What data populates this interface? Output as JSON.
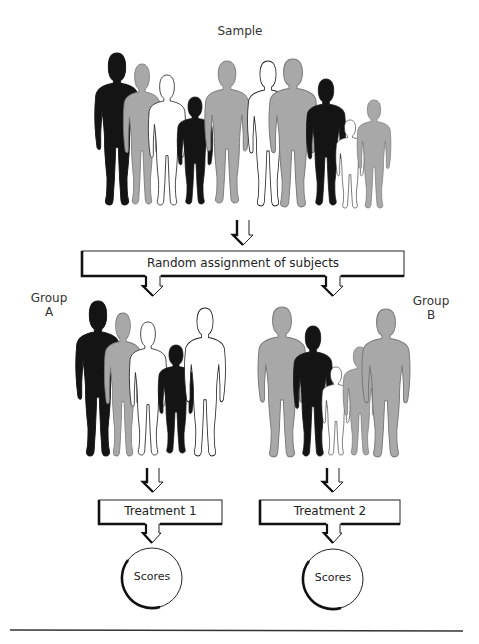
{
  "figure": {
    "sample_label": "Sample",
    "assignment_label": "Random assignment of subjects",
    "group_a": {
      "label_line1": "Group",
      "label_line2": "A"
    },
    "group_b": {
      "label_line1": "Group",
      "label_line2": "B"
    },
    "treatment_1_label": "Treatment 1",
    "treatment_2_label": "Treatment 2",
    "outcome_a_label": "Scores",
    "outcome_b_label": "Scores"
  },
  "sample_people": [
    {
      "fill": "black",
      "size": "tall"
    },
    {
      "fill": "gray",
      "size": "medium"
    },
    {
      "fill": "white",
      "size": "medium"
    },
    {
      "fill": "black",
      "size": "short"
    },
    {
      "fill": "gray",
      "size": "tall"
    },
    {
      "fill": "white",
      "size": "tall"
    },
    {
      "fill": "gray",
      "size": "tall"
    },
    {
      "fill": "black",
      "size": "medium"
    },
    {
      "fill": "white",
      "size": "child"
    },
    {
      "fill": "gray",
      "size": "short"
    }
  ],
  "group_a_people": [
    {
      "fill": "black",
      "size": "tall"
    },
    {
      "fill": "gray",
      "size": "medium"
    },
    {
      "fill": "white",
      "size": "medium"
    },
    {
      "fill": "black",
      "size": "short"
    },
    {
      "fill": "white",
      "size": "tall"
    }
  ],
  "group_b_people": [
    {
      "fill": "gray",
      "size": "tall"
    },
    {
      "fill": "black",
      "size": "medium"
    },
    {
      "fill": "white",
      "size": "child"
    },
    {
      "fill": "gray",
      "size": "short"
    },
    {
      "fill": "gray",
      "size": "tall"
    }
  ],
  "colors": {
    "black": "#141414",
    "gray": "#a8a8a8",
    "white": "#ffffff",
    "outline": "#222222"
  }
}
